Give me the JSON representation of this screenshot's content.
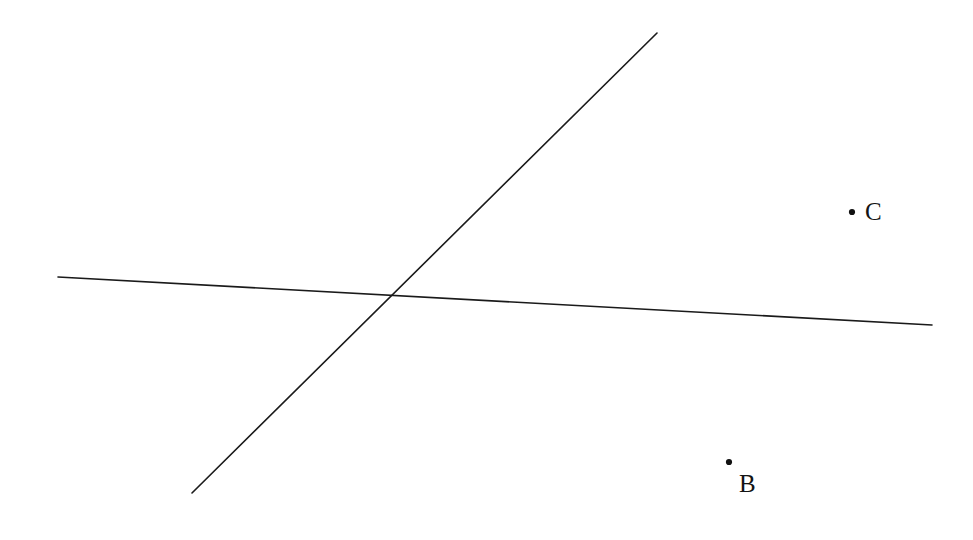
{
  "figure": {
    "width": 973,
    "height": 540,
    "background_color": "#ffffff",
    "stroke_color": "#1a1a1a",
    "label_color": "#141414",
    "point_color": "#111111",
    "stroke_width": 1.6,
    "point_radius": 3.1,
    "label_font_size": 25
  },
  "labels": {
    "point_b": "B",
    "point_c": "C"
  },
  "chart_data": {
    "type": "scatter",
    "title": "",
    "subtitle": "",
    "xlabel": "",
    "ylabel": "",
    "grid": false,
    "legend": false,
    "axes_visible": false,
    "coordinate_system": "screen-pixels-origin-top-left",
    "xlim": [
      0,
      973
    ],
    "ylim": [
      0,
      540
    ],
    "annotations": [
      {
        "name": "point-b-label",
        "text": "B",
        "x": 750,
        "y": 484
      },
      {
        "name": "point-c-label",
        "text": "C",
        "x": 876,
        "y": 212
      }
    ],
    "points": [
      {
        "name": "B",
        "label": "B",
        "x": 729,
        "y": 462,
        "label_position": "below-right"
      },
      {
        "name": "C",
        "label": "C",
        "x": 852,
        "y": 212,
        "label_position": "right"
      }
    ],
    "lines": [
      {
        "name": "near-horizontal-line",
        "x1": 58,
        "y1": 277,
        "x2": 932,
        "y2": 325,
        "slope": 0.055,
        "orientation": "near-horizontal"
      },
      {
        "name": "steep-diagonal-line",
        "x1": 192,
        "y1": 493,
        "x2": 657,
        "y2": 33,
        "slope": -0.989,
        "orientation": "rising-left-to-right"
      }
    ],
    "intersections": [
      {
        "name": "lines-crossing-point",
        "x": 388,
        "y": 296,
        "marked": false
      }
    ]
  }
}
